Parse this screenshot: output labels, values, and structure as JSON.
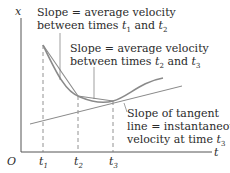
{
  "diagram": {
    "axes": {
      "y_label": "x",
      "x_label": "t",
      "origin_label": "O"
    },
    "ticks": [
      {
        "label": "t",
        "sub": "1"
      },
      {
        "label": "t",
        "sub": "2"
      },
      {
        "label": "t",
        "sub": "3"
      }
    ],
    "annotations": [
      {
        "line1": "Slope  = average velocity",
        "line2_prefix": "between times ",
        "t_a": "t",
        "t_a_sub": "1",
        "and": " and ",
        "t_b": "t",
        "t_b_sub": "2"
      },
      {
        "line1": "Slope  = average velocity",
        "line2_prefix": "between times ",
        "t_a": "t",
        "t_a_sub": "2",
        "and": " and ",
        "t_b": "t",
        "t_b_sub": "3"
      },
      {
        "line1": "Slope of tangent",
        "line2": "line = instantaneous",
        "line3_prefix": "velocity at time ",
        "t_a": "t",
        "t_a_sub": "3"
      }
    ],
    "colors": {
      "curve": "#8a8a8a",
      "chord": "#8a8a8a",
      "tangent": "#8a8a8a",
      "axis": "#555555",
      "text": "#2b2b2b"
    }
  }
}
